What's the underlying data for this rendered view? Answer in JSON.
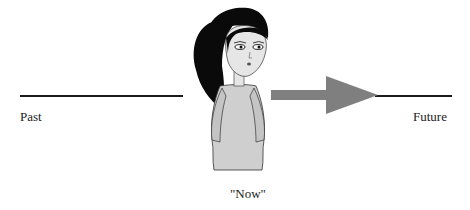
{
  "diagram": {
    "labels": {
      "past": "Past",
      "future": "Future",
      "now": "\"Now\""
    },
    "colors": {
      "line": "#1a1a1a",
      "arrow": "#7f7f7f",
      "hair": "#0a0a0a",
      "skin": "#e6e6e6",
      "dress": "#cfcfcf",
      "background": "#ffffff"
    },
    "elements": {
      "past_line": "timeline-past",
      "arrow": "arrow-right",
      "future_line": "timeline-future",
      "figure": "girl-figure"
    }
  }
}
